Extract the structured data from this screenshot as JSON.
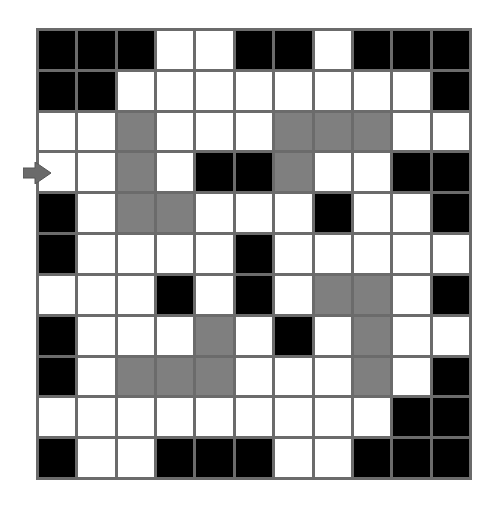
{
  "puzzle": {
    "type": "maze-grid",
    "rows": 11,
    "cols": 11,
    "legend": {
      "W": "open",
      "B": "wall",
      "G": "path"
    },
    "colors": {
      "open": "#ffffff",
      "wall": "#000000",
      "path": "#7f7f7f",
      "grid_line": "#6b6b6b",
      "arrow": "#6b6b6b"
    },
    "grid": [
      [
        "B",
        "B",
        "B",
        "W",
        "W",
        "B",
        "B",
        "W",
        "B",
        "B",
        "B"
      ],
      [
        "B",
        "B",
        "W",
        "W",
        "W",
        "W",
        "W",
        "W",
        "W",
        "W",
        "B"
      ],
      [
        "W",
        "W",
        "G",
        "W",
        "W",
        "W",
        "G",
        "G",
        "G",
        "W",
        "W"
      ],
      [
        "W",
        "W",
        "G",
        "W",
        "B",
        "B",
        "G",
        "W",
        "W",
        "B",
        "B"
      ],
      [
        "B",
        "W",
        "G",
        "G",
        "W",
        "W",
        "W",
        "B",
        "W",
        "W",
        "B"
      ],
      [
        "B",
        "W",
        "W",
        "W",
        "W",
        "B",
        "W",
        "W",
        "W",
        "W",
        "W"
      ],
      [
        "W",
        "W",
        "W",
        "B",
        "W",
        "B",
        "W",
        "G",
        "G",
        "W",
        "B"
      ],
      [
        "B",
        "W",
        "W",
        "W",
        "G",
        "W",
        "B",
        "W",
        "G",
        "W",
        "W"
      ],
      [
        "B",
        "W",
        "G",
        "G",
        "G",
        "W",
        "W",
        "W",
        "G",
        "W",
        "B"
      ],
      [
        "W",
        "W",
        "W",
        "W",
        "W",
        "W",
        "W",
        "W",
        "W",
        "B",
        "B"
      ],
      [
        "B",
        "W",
        "W",
        "B",
        "B",
        "B",
        "W",
        "W",
        "B",
        "B",
        "B"
      ]
    ],
    "entry_arrow": {
      "row": 3,
      "side": "left",
      "direction": "right",
      "icon": "arrow-right-icon"
    }
  }
}
